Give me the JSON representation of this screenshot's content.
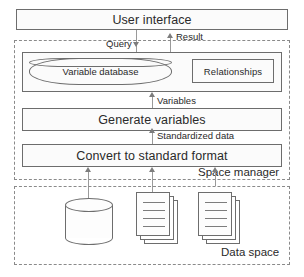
{
  "diagram": {
    "nodes": {
      "user_interface": "User interface",
      "variable_database": "Variable database",
      "relationships": "Relationships",
      "generate_variables": "Generate variables",
      "convert_to_standard_format": "Convert to standard format"
    },
    "zones": {
      "space_manager": "Space manager",
      "data_space": "Data space"
    },
    "flows": {
      "query": "Query",
      "result": "Result",
      "variables": "Variables",
      "standardized_data": "Standardized data"
    },
    "data_space_items": {
      "database_icon": "database-cylinder",
      "document_stack_1": "document-stack",
      "document_stack_2": "document-stack"
    },
    "colors": {
      "stroke": "#6d6d6d",
      "connector": "#9a9a9a",
      "arrow": "#7d7d7d",
      "text": "#2a2a2a",
      "fill": "#fbfbfb",
      "background": "#ffffff"
    }
  }
}
